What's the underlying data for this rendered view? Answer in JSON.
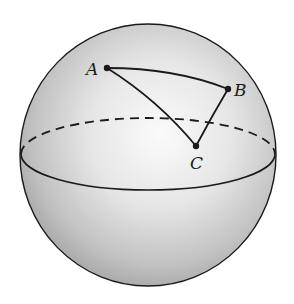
{
  "figure": {
    "sphere": {
      "cx": 148,
      "cy": 155,
      "rx": 128,
      "ry": 131
    },
    "equator": {
      "cx": 148,
      "cy": 154,
      "rx": 127,
      "ry": 36,
      "back_style": "dashed",
      "front_style": "solid"
    },
    "points": [
      {
        "label": "A",
        "x": 107,
        "y": 68,
        "label_x": 86,
        "label_y": 75
      },
      {
        "label": "B",
        "x": 228,
        "y": 89,
        "label_x": 234,
        "label_y": 96
      },
      {
        "label": "C",
        "x": 196,
        "y": 146,
        "label_x": 190,
        "label_y": 169
      }
    ],
    "colors": {
      "line": "#1a1a1a",
      "sphere_light": "#f4f4f4",
      "sphere_dark": "#a8a8a8",
      "background": "#ffffff"
    }
  }
}
